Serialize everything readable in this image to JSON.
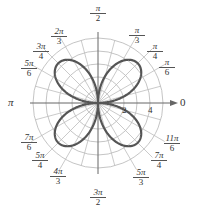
{
  "chart_data": {
    "type": "polar",
    "title": "",
    "equation": "r = 4 sin 2θ",
    "curve": {
      "amplitude": 4,
      "k": 2,
      "petals": 4,
      "petal_angles": [
        "π/4",
        "3π/4",
        "5π/4",
        "7π/4"
      ]
    },
    "radial_grid": [
      1,
      2,
      3,
      4,
      5
    ],
    "radial_tick_labels": [
      "2",
      "4"
    ],
    "angle_axis_labels": {
      "zero": "0",
      "pi": "π"
    },
    "angular_ticks": [
      {
        "id": "pi_2",
        "num": "π",
        "den": "2",
        "x": 98,
        "y": 12
      },
      {
        "id": "pi_3",
        "num": "π",
        "den": "3",
        "x": 137,
        "y": 34
      },
      {
        "id": "pi_4",
        "num": "π",
        "den": "4",
        "x": 155,
        "y": 50
      },
      {
        "id": "pi_6",
        "num": "π",
        "den": "6",
        "x": 167,
        "y": 66
      },
      {
        "id": "2pi_3",
        "num": "2π",
        "den": "3",
        "x": 59,
        "y": 35
      },
      {
        "id": "3pi_4",
        "num": "3π",
        "den": "4",
        "x": 41,
        "y": 50
      },
      {
        "id": "5pi_6",
        "num": "5π",
        "den": "6",
        "x": 29,
        "y": 67
      },
      {
        "id": "7pi_6",
        "num": "7π",
        "den": "6",
        "x": 29,
        "y": 141
      },
      {
        "id": "5pi_4",
        "num": "5π",
        "den": "4",
        "x": 40,
        "y": 159
      },
      {
        "id": "4pi_3",
        "num": "4π",
        "den": "3",
        "x": 58,
        "y": 175
      },
      {
        "id": "3pi_2",
        "num": "3π",
        "den": "2",
        "x": 98,
        "y": 196
      },
      {
        "id": "5pi_3",
        "num": "5π",
        "den": "3",
        "x": 141,
        "y": 176
      },
      {
        "id": "7pi_4",
        "num": "7π",
        "den": "4",
        "x": 159,
        "y": 159
      },
      {
        "id": "11pi_6",
        "num": "11π",
        "den": "6",
        "x": 172,
        "y": 142
      }
    ]
  },
  "colors": {
    "grid": "#bdbdbd",
    "curve": "#555555",
    "axis": "#666666",
    "text": "#333333"
  }
}
